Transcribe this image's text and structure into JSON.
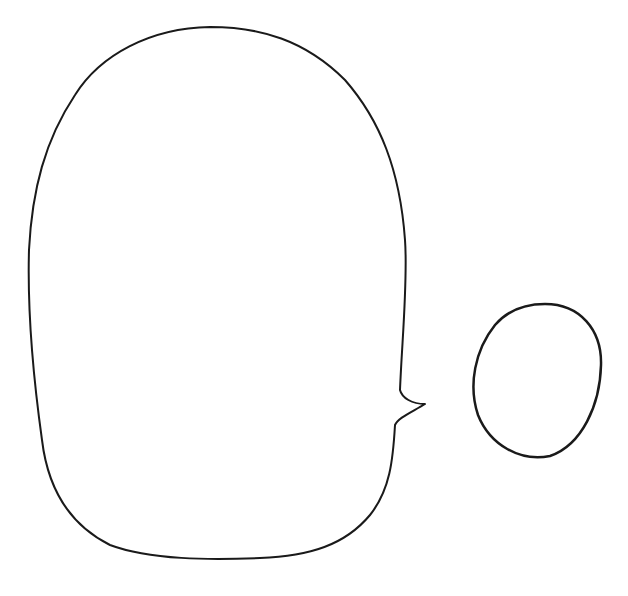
{
  "drawing": {
    "description": "Hand-drawn outline: large rounded speech-bubble shape with small tail on right side, and a separate small oval",
    "stroke_color": "#1a1a1a",
    "background_color": "#ffffff",
    "shapes": [
      {
        "name": "speech-bubble",
        "type": "rounded-blob-with-tail"
      },
      {
        "name": "small-oval",
        "type": "ellipse"
      }
    ]
  }
}
